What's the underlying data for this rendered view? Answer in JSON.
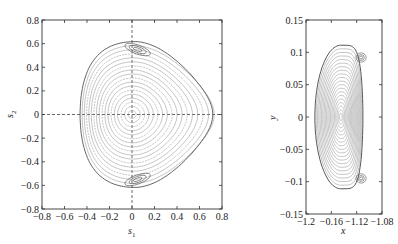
{
  "chart_data": [
    {
      "type": "line",
      "title": "",
      "xlabel": "s1",
      "ylabel": "s2",
      "xlim": [
        -0.8,
        0.8
      ],
      "ylim": [
        -0.8,
        0.8
      ],
      "xticks": [
        -0.8,
        -0.6,
        -0.4,
        -0.2,
        0,
        0.2,
        0.4,
        0.6,
        0.8
      ],
      "yticks": [
        -0.8,
        -0.6,
        -0.4,
        -0.2,
        0,
        0.2,
        0.4,
        0.6,
        0.8
      ],
      "xtick_labels": [
        "-0.8",
        "-0.6",
        "-0.4",
        "-0.2",
        "0",
        "0.2",
        "0.4",
        "0.6",
        "0.8"
      ],
      "ytick_labels": [
        "-0.8",
        "-0.6",
        "-0.4",
        "-0.2",
        "0",
        "0.2",
        "0.4",
        "0.6",
        "0.8"
      ],
      "grid": false,
      "reference_lines": [
        {
          "axis": "x",
          "value": 0,
          "style": "dashed"
        },
        {
          "axis": "y",
          "value": 0,
          "style": "dashed"
        }
      ],
      "description": "Phase portrait: nested closed orbits around origin bounded by a triangular separatrix; two island chains near (0.05, 0.55) and (0.05, -0.55)",
      "separatrix": {
        "left": -0.62,
        "right_tip": 0.67,
        "top": 0.63,
        "bottom": -0.63,
        "top_at_s1": -0.2
      },
      "islands": [
        {
          "center": [
            0.05,
            0.55
          ]
        },
        {
          "center": [
            0.05,
            -0.55
          ]
        }
      ],
      "n_contours": 18
    },
    {
      "type": "line",
      "title": "",
      "xlabel": "x",
      "ylabel": "y",
      "xlim": [
        -1.2,
        -1.08
      ],
      "ylim": [
        -0.15,
        0.15
      ],
      "xticks": [
        -1.2,
        -1.16,
        -1.12,
        -1.08
      ],
      "yticks": [
        -0.15,
        -0.1,
        -0.05,
        0,
        0.05,
        0.1,
        0.15
      ],
      "xtick_labels": [
        "-1.2",
        "-0.16",
        "-1.12",
        "-1.08"
      ],
      "ytick_labels": [
        "-0.15",
        "-0.1",
        "-0.05",
        "0",
        "0.05",
        "0.1",
        "0.15"
      ],
      "grid": false,
      "description": "Phase portrait in x-y: nested closed orbits around (-1.145, 0) bounded by D-shaped separatrix; islands near (-1.113, 0.09) and (-1.113, -0.095)",
      "separatrix": {
        "left": -1.186,
        "right": -1.104,
        "top": 0.11,
        "bottom": -0.112
      },
      "islands": [
        {
          "center": [
            -1.113,
            0.092
          ]
        },
        {
          "center": [
            -1.113,
            -0.095
          ]
        }
      ],
      "n_contours": 20
    }
  ],
  "colors": {
    "frame": "#333333",
    "contour": "#8a8a8a",
    "separatrix": "#555555",
    "dash": "#444444"
  }
}
